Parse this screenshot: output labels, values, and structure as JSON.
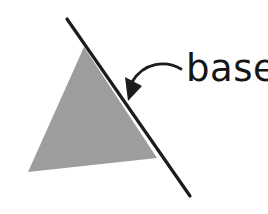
{
  "figure": {
    "background_color": "#ffffff",
    "shapes": {
      "triangle": {
        "name": "gray-triangle",
        "fill_color": "#9d9d9d",
        "points": "84,47 28,172 157,158"
      },
      "base_line": {
        "name": "base-line",
        "stroke_color": "#1c1c1c",
        "stroke_width": 3.2,
        "x1": 67,
        "y1": 19,
        "x2": 190,
        "y2": 196
      },
      "arrow_curve": {
        "name": "arrow-curve",
        "stroke_color": "#1c1c1c",
        "stroke_width": 2.8,
        "path": "M 181 69 C 166 60, 144 62, 132 82"
      },
      "arrow_head": {
        "name": "arrow-head",
        "fill_color": "#1c1c1c",
        "points": "128,101 125,77 142,86"
      }
    },
    "label": {
      "name": "base-label",
      "text": "base",
      "color": "#151515",
      "x": 186,
      "y": 81,
      "font_size_px": 37
    }
  }
}
